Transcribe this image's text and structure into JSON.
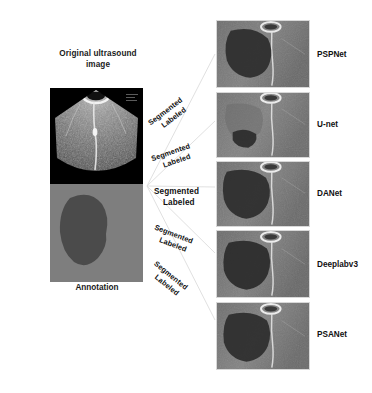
{
  "figure": {
    "type": "segmentation-comparison-figure",
    "background": "#ffffff"
  },
  "left_column": {
    "original": {
      "title_line1": "Original ultrasound",
      "title_line2": "image",
      "image_name": "original-ultrasound-image",
      "description": "Grayscale transverse ultrasound scan with dark background and bright speckle tissue texture"
    },
    "annotation": {
      "caption": "Annotation",
      "image_name": "annotation-mask-image",
      "background_color": "#7e7e7e",
      "lesion_color": "#4b4b4b",
      "description": "Flat gray annotation mask with a single dark filled lesion region on the left"
    }
  },
  "fan_labels": [
    {
      "line1": "Segmented",
      "line2": "Labeled",
      "target": "PSPNet",
      "angle": -37
    },
    {
      "line1": "Segmented",
      "line2": "Labeled",
      "target": "U-net",
      "angle": -19
    },
    {
      "line1": "Segmented",
      "line2": "Labeled",
      "target": "DANet",
      "angle": 0
    },
    {
      "line1": "Segmented",
      "line2": "Labeled",
      "target": "Deeplabv3",
      "angle": 21
    },
    {
      "line1": "Segmented",
      "line2": "Labeled",
      "target": "PSANet",
      "angle": 39
    }
  ],
  "results": [
    {
      "label": "PSPNet",
      "image_name": "result-image-pspnet",
      "description": "Ultrasound crop with large dark segmented region occupying left half"
    },
    {
      "label": "U-net",
      "image_name": "result-image-u-net",
      "description": "Ultrasound crop with small dark segmented region at lower left"
    },
    {
      "label": "DANet",
      "image_name": "result-image-danet",
      "description": "Ultrasound crop with large dark segmented region occupying left half"
    },
    {
      "label": "Deeplabv3",
      "image_name": "result-image-deeplabv3",
      "description": "Ultrasound crop with large dark segmented region occupying left half"
    },
    {
      "label": "PSANet",
      "image_name": "result-image-psanet",
      "description": "Ultrasound crop with large dark segmented region occupying left half"
    }
  ]
}
